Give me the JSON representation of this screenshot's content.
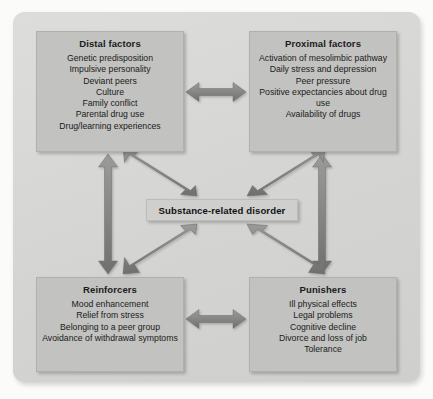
{
  "figure": {
    "name": "substance-related-disorder-model",
    "background_color": "#d4d4d2",
    "box_color": "#c2c2c0",
    "center_box_color": "#cfcfcd",
    "arrow_color": "#8f8f8d",
    "text_color": "#1b1b1b"
  },
  "center": {
    "label": "Substance-related disorder"
  },
  "boxes": [
    {
      "id": "distal",
      "title": "Distal factors",
      "items": [
        "Genetic predisposition",
        "Impulsive personality",
        "Deviant peers",
        "Culture",
        "Family conflict",
        "Parental drug use",
        "Drug/learning experiences"
      ]
    },
    {
      "id": "proximal",
      "title": "Proximal factors",
      "items": [
        "Activation of mesolimbic pathway",
        "Daily stress and depression",
        "Peer pressure",
        "Positive expectancies about drug use",
        "Availability of drugs"
      ]
    },
    {
      "id": "reinforcers",
      "title": "Reinforcers",
      "items": [
        "Mood enhancement",
        "Relief from stress",
        "Belonging to a peer group",
        "Avoidance of withdrawal symptoms"
      ]
    },
    {
      "id": "punishers",
      "title": "Punishers",
      "items": [
        "Ill physical effects",
        "Legal problems",
        "Cognitive decline",
        "Divorce and loss of job",
        "Tolerance"
      ]
    }
  ],
  "arrows": [
    {
      "id": "distal-proximal",
      "from": "Distal factors",
      "to": "Proximal factors",
      "style": "double-headed",
      "orientation": "horizontal"
    },
    {
      "id": "reinf-punish",
      "from": "Reinforcers",
      "to": "Punishers",
      "style": "double-headed",
      "orientation": "horizontal"
    },
    {
      "id": "distal-reinf",
      "from": "Distal factors",
      "to": "Reinforcers",
      "style": "double-headed",
      "orientation": "vertical"
    },
    {
      "id": "proximal-punish",
      "from": "Proximal factors",
      "to": "Punishers",
      "style": "double-headed",
      "orientation": "vertical"
    },
    {
      "id": "distal-center",
      "from": "Distal factors",
      "to": "Substance-related disorder",
      "style": "single-headed",
      "orientation": "diagonal"
    },
    {
      "id": "proximal-center",
      "from": "Proximal factors",
      "to": "Substance-related disorder",
      "style": "single-headed",
      "orientation": "diagonal"
    },
    {
      "id": "center-reinf",
      "from": "Substance-related disorder",
      "to": "Reinforcers",
      "style": "single-headed",
      "orientation": "diagonal"
    },
    {
      "id": "center-punish",
      "from": "Substance-related disorder",
      "to": "Punishers",
      "style": "single-headed",
      "orientation": "diagonal"
    }
  ]
}
